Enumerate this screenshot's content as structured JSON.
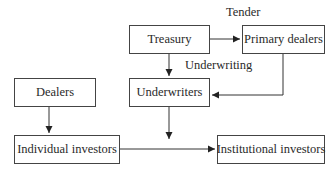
{
  "diagram": {
    "nodes": [
      {
        "id": "treasury",
        "label": "Treasury"
      },
      {
        "id": "primary_dealers",
        "label": "Primary dealers"
      },
      {
        "id": "dealers",
        "label": "Dealers"
      },
      {
        "id": "underwriters",
        "label": "Underwriters"
      },
      {
        "id": "individual_investors",
        "label": "Individual investors"
      },
      {
        "id": "institutional_investors",
        "label": "Institutional investors"
      }
    ],
    "edge_labels": {
      "tender": "Tender",
      "underwriting": "Underwriting"
    },
    "edges": [
      {
        "from": "treasury",
        "to": "primary_dealers",
        "label": "Tender"
      },
      {
        "from": "treasury",
        "to": "underwriters",
        "label": "Underwriting"
      },
      {
        "from": "primary_dealers",
        "to": "underwriters",
        "label": ""
      },
      {
        "from": "dealers",
        "to": "individual_investors",
        "label": ""
      },
      {
        "from": "underwriters",
        "to": "individual_investors/institutional_investors flow",
        "label": ""
      },
      {
        "from": "individual_investors",
        "to": "institutional_investors",
        "label": ""
      }
    ],
    "colors": {
      "line": "#333333",
      "text": "#2a2a2a",
      "background": "#ffffff"
    }
  }
}
